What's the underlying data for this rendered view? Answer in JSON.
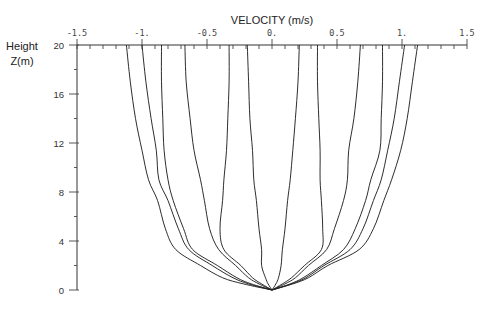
{
  "chart_data": {
    "type": "line",
    "title": "",
    "xlabel": "VELOCITY (m/s)",
    "ylabel_line1": "Height",
    "ylabel_line2": "Z(m)",
    "xlim": [
      -1.5,
      1.5
    ],
    "ylim": [
      0,
      20
    ],
    "xaxis_position": "top",
    "x_ticks": [
      -1.5,
      -1.0,
      -0.5,
      0.0,
      0.5,
      1.0,
      1.5
    ],
    "x_tick_labels": [
      "-1.5",
      "-1.",
      "-0.5",
      "0.",
      "0.5",
      "1.",
      "1.5"
    ],
    "x_minor_step": 0.1,
    "y_ticks": [
      0,
      4,
      8,
      12,
      16,
      20
    ],
    "y_tick_labels": [
      "0",
      "4",
      "8",
      "12",
      "16",
      "20"
    ],
    "y_minor_step": 2,
    "grid": false,
    "legend": "none",
    "z": [
      0,
      0.5,
      1,
      2,
      3.3,
      5,
      7.3,
      9,
      11.4,
      14,
      17,
      20
    ],
    "series": [
      {
        "name": "profile-1",
        "values": [
          0,
          -0.22,
          -0.38,
          -0.55,
          -0.74,
          -0.82,
          -0.88,
          -0.95,
          -1.0,
          -1.05,
          -1.09,
          -1.12
        ]
      },
      {
        "name": "profile-2",
        "values": [
          0,
          -0.18,
          -0.3,
          -0.46,
          -0.64,
          -0.72,
          -0.8,
          -0.87,
          -0.89,
          -0.93,
          -0.97,
          -1.0
        ]
      },
      {
        "name": "profile-3",
        "values": [
          0,
          -0.16,
          -0.27,
          -0.42,
          -0.61,
          -0.68,
          -0.76,
          -0.8,
          -0.83,
          -0.84,
          -0.85,
          -0.85
        ]
      },
      {
        "name": "profile-4",
        "values": [
          0,
          -0.1,
          -0.18,
          -0.28,
          -0.41,
          -0.48,
          -0.52,
          -0.55,
          -0.6,
          -0.63,
          -0.66,
          -0.67
        ]
      },
      {
        "name": "profile-5",
        "values": [
          0,
          -0.08,
          -0.15,
          -0.24,
          -0.37,
          -0.4,
          -0.38,
          -0.37,
          -0.35,
          -0.34,
          -0.33,
          -0.33
        ]
      },
      {
        "name": "profile-6",
        "values": [
          0,
          -0.03,
          -0.05,
          -0.08,
          -0.08,
          -0.1,
          -0.12,
          -0.14,
          -0.15,
          -0.17,
          -0.18,
          -0.19
        ]
      },
      {
        "name": "profile-7",
        "values": [
          0,
          0.03,
          0.05,
          0.07,
          0.08,
          0.1,
          0.12,
          0.14,
          0.16,
          0.18,
          0.2,
          0.21
        ]
      },
      {
        "name": "profile-8",
        "values": [
          0,
          0.08,
          0.15,
          0.25,
          0.38,
          0.39,
          0.38,
          0.37,
          0.37,
          0.36,
          0.35,
          0.35
        ]
      },
      {
        "name": "profile-9",
        "values": [
          0,
          0.1,
          0.18,
          0.28,
          0.42,
          0.48,
          0.55,
          0.58,
          0.59,
          0.63,
          0.66,
          0.68
        ]
      },
      {
        "name": "profile-10",
        "values": [
          0,
          0.14,
          0.24,
          0.38,
          0.55,
          0.64,
          0.72,
          0.76,
          0.83,
          0.84,
          0.85,
          0.85
        ]
      },
      {
        "name": "profile-11",
        "values": [
          0,
          0.15,
          0.26,
          0.4,
          0.6,
          0.7,
          0.78,
          0.84,
          0.89,
          0.94,
          0.98,
          1.02
        ]
      },
      {
        "name": "profile-12",
        "values": [
          0,
          0.16,
          0.28,
          0.43,
          0.67,
          0.78,
          0.86,
          0.92,
          0.99,
          1.04,
          1.08,
          1.12
        ]
      }
    ]
  }
}
